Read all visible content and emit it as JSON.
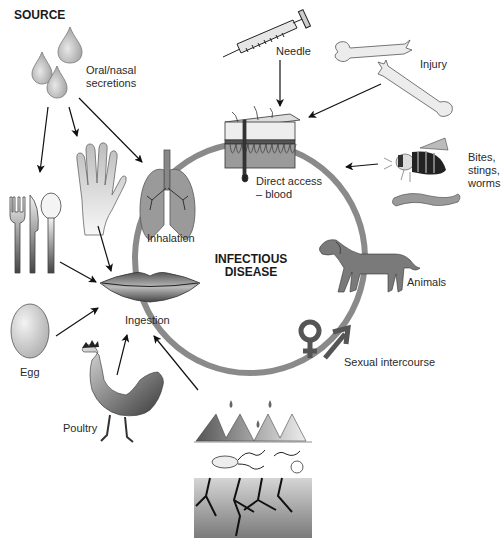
{
  "diagram": {
    "title": "SOURCE",
    "center_label": [
      "INFECTIOUS",
      "DISEASE"
    ],
    "ring_color": "#8a8a8a",
    "nodes": [
      {
        "id": "oral-nasal-secretions",
        "label": [
          "Oral/nasal",
          "secretions"
        ],
        "icon": "droplets-icon"
      },
      {
        "id": "needle",
        "label": [
          "Needle"
        ],
        "icon": "syringe-icon"
      },
      {
        "id": "injury",
        "label": [
          "Injury"
        ],
        "icon": "broken-bone-icon"
      },
      {
        "id": "direct-access-blood",
        "label": [
          "Direct access",
          "– blood"
        ],
        "icon": "skin-section-icon"
      },
      {
        "id": "bites-stings-worms",
        "label": [
          "Bites,",
          "stings,",
          "worms"
        ],
        "icon": "bee-worm-icon"
      },
      {
        "id": "inhalation",
        "label": [
          "Inhalation"
        ],
        "icon": "lungs-icon"
      },
      {
        "id": "animals",
        "label": [
          "Animals"
        ],
        "icon": "dog-icon"
      },
      {
        "id": "ingestion",
        "label": [
          "Ingestion"
        ],
        "icon": "lips-icon"
      },
      {
        "id": "sexual-intercourse",
        "label": [
          "Sexual intercourse"
        ],
        "icon": "gender-symbols-icon"
      },
      {
        "id": "egg",
        "label": [
          "Egg"
        ],
        "icon": "egg-icon"
      },
      {
        "id": "poultry",
        "label": [
          "Poultry"
        ],
        "icon": "rooster-icon"
      },
      {
        "id": "utensils",
        "label": [],
        "icon": "utensils-icon"
      },
      {
        "id": "hand",
        "label": [],
        "icon": "hand-icon"
      },
      {
        "id": "contaminated-environment",
        "label": [],
        "icon": "soil-water-microbes-icon"
      }
    ],
    "edges": [
      {
        "from": "oral-nasal-secretions",
        "to": "utensils"
      },
      {
        "from": "oral-nasal-secretions",
        "to": "hand"
      },
      {
        "from": "oral-nasal-secretions",
        "to": "inhalation"
      },
      {
        "from": "utensils",
        "to": "ingestion"
      },
      {
        "from": "hand",
        "to": "ingestion"
      },
      {
        "from": "egg",
        "to": "ingestion"
      },
      {
        "from": "poultry",
        "to": "ingestion"
      },
      {
        "from": "contaminated-environment",
        "to": "ingestion"
      },
      {
        "from": "needle",
        "to": "direct-access-blood"
      },
      {
        "from": "injury",
        "to": "direct-access-blood"
      },
      {
        "from": "bites-stings-worms",
        "to": "direct-access-blood"
      }
    ]
  }
}
